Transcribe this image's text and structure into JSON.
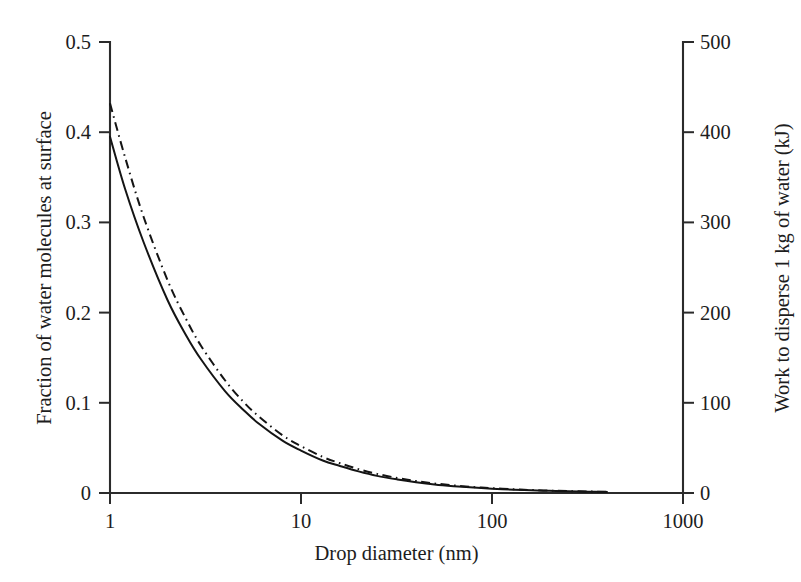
{
  "chart_data": {
    "type": "line",
    "title": "",
    "xlabel": "Drop diameter (nm)",
    "ylabel": "Fraction of water molecules at surface",
    "y2label": "Work to disperse 1 kg of water (kJ)",
    "xscale": "log",
    "xlim": [
      1,
      1000
    ],
    "ylim": [
      0,
      0.5
    ],
    "y2lim": [
      0,
      500
    ],
    "grid": false,
    "legend": "none",
    "xticks": [
      "1",
      "10",
      "100",
      "1000"
    ],
    "xtick_values": [
      1,
      10,
      100,
      1000
    ],
    "yticks": [
      "0",
      "0.1",
      "0.2",
      "0.3",
      "0.4",
      "0.5"
    ],
    "ytick_values": [
      0,
      0.1,
      0.2,
      0.3,
      0.4,
      0.5
    ],
    "y2ticks": [
      "0",
      "100",
      "200",
      "300",
      "400",
      "500"
    ],
    "y2tick_values": [
      0,
      100,
      200,
      300,
      400,
      500
    ],
    "series": [
      {
        "name": "fraction-of-water-molecules-at-surface",
        "style": "solid",
        "x": [
          1,
          1.2,
          1.5,
          2,
          2.5,
          3,
          4,
          5,
          6,
          8,
          10,
          13,
          16,
          20,
          25,
          32,
          40,
          50,
          63,
          80,
          100,
          130,
          160,
          200,
          250,
          320,
          400
        ],
        "values": [
          0.395,
          0.337,
          0.278,
          0.214,
          0.175,
          0.148,
          0.113,
          0.092,
          0.077,
          0.058,
          0.047,
          0.036,
          0.03,
          0.024,
          0.019,
          0.015,
          0.012,
          0.0095,
          0.0076,
          0.006,
          0.0048,
          0.0037,
          0.003,
          0.0024,
          0.0019,
          0.0015,
          0.0012
        ]
      },
      {
        "name": "work-to-disperse-1-kg-of-water",
        "style": "dash-dot",
        "x": [
          1,
          1.2,
          1.5,
          2,
          2.5,
          3,
          4,
          5,
          6,
          8,
          10,
          13,
          16,
          20,
          25,
          32,
          40,
          50,
          63,
          80,
          100,
          130,
          160,
          200,
          250,
          320,
          400
        ],
        "values": [
          0.432,
          0.372,
          0.306,
          0.236,
          0.193,
          0.163,
          0.125,
          0.101,
          0.085,
          0.064,
          0.052,
          0.04,
          0.033,
          0.0265,
          0.0212,
          0.0166,
          0.0133,
          0.0106,
          0.0084,
          0.0066,
          0.0053,
          0.0041,
          0.0033,
          0.0027,
          0.0021,
          0.0017,
          0.0013
        ]
      }
    ]
  },
  "figure": {
    "background_color": "#ffffff",
    "ink_color": "#141414"
  }
}
